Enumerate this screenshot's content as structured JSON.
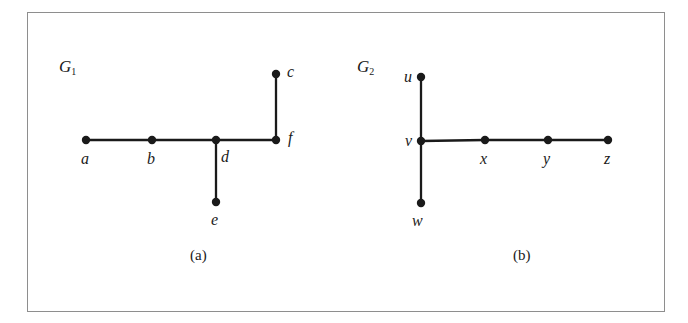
{
  "figure": {
    "background_color": "#ffffff",
    "frame_color": "#8e8e8e",
    "ink_color": "#1a1a1a"
  },
  "panels": [
    {
      "id": "panel-a",
      "graph_label": "G",
      "graph_label_sub": "1",
      "caption": "(a)",
      "caption_pos": {
        "x": 190,
        "y": 248
      },
      "graph_label_pos": {
        "x": 59,
        "y": 58
      },
      "nodes": [
        {
          "id": "a",
          "label": "a",
          "x": 86,
          "y": 140,
          "label_x": 81,
          "label_y": 151
        },
        {
          "id": "b",
          "label": "b",
          "x": 152,
          "y": 140,
          "label_x": 147,
          "label_y": 151
        },
        {
          "id": "d",
          "label": "d",
          "x": 216,
          "y": 140,
          "label_x": 221,
          "label_y": 149
        },
        {
          "id": "f",
          "label": "f",
          "x": 276,
          "y": 140,
          "label_x": 288,
          "label_y": 130
        },
        {
          "id": "c",
          "label": "c",
          "x": 276,
          "y": 74,
          "label_x": 287,
          "label_y": 64
        },
        {
          "id": "e",
          "label": "e",
          "x": 216,
          "y": 202,
          "label_x": 211,
          "label_y": 212
        }
      ],
      "edges": [
        {
          "from": "a",
          "to": "b"
        },
        {
          "from": "b",
          "to": "d"
        },
        {
          "from": "d",
          "to": "f"
        },
        {
          "from": "d",
          "to": "e"
        },
        {
          "from": "f",
          "to": "c"
        }
      ]
    },
    {
      "id": "panel-b",
      "graph_label": "G",
      "graph_label_sub": "2",
      "caption": "(b)",
      "caption_pos": {
        "x": 513,
        "y": 248
      },
      "graph_label_pos": {
        "x": 357,
        "y": 58
      },
      "nodes": [
        {
          "id": "u",
          "label": "u",
          "x": 421,
          "y": 77,
          "label_x": 404,
          "label_y": 69
        },
        {
          "id": "v",
          "label": "v",
          "x": 421,
          "y": 141,
          "label_x": 405,
          "label_y": 133
        },
        {
          "id": "w",
          "label": "w",
          "x": 421,
          "y": 203,
          "label_x": 412,
          "label_y": 213
        },
        {
          "id": "x",
          "label": "x",
          "x": 485,
          "y": 140,
          "label_x": 480,
          "label_y": 151
        },
        {
          "id": "y",
          "label": "y",
          "x": 548,
          "y": 140,
          "label_x": 543,
          "label_y": 151
        },
        {
          "id": "z",
          "label": "z",
          "x": 608,
          "y": 140,
          "label_x": 604,
          "label_y": 151
        }
      ],
      "edges": [
        {
          "from": "u",
          "to": "v"
        },
        {
          "from": "v",
          "to": "w"
        },
        {
          "from": "v",
          "to": "x"
        },
        {
          "from": "x",
          "to": "y"
        },
        {
          "from": "y",
          "to": "z"
        }
      ]
    }
  ],
  "style": {
    "node_radius": 4.2,
    "edge_width": 2.3
  }
}
